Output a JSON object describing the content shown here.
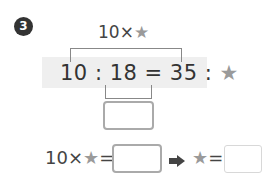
{
  "problem": {
    "number": "3",
    "top_label": {
      "prefix": "10×",
      "star": "★"
    },
    "equation": {
      "left": "10 : 18",
      "equals": " = ",
      "right_prefix": "35 : ",
      "star": "★"
    },
    "answer_box_1": {
      "value": ""
    },
    "second_line": {
      "prefix": "10×",
      "star": "★",
      "equals": "=",
      "answer_box_2": {
        "value": ""
      },
      "arrow": "arrow-right-icon",
      "result_star": "★",
      "result_equals": "=",
      "answer_box_3": {
        "value": ""
      }
    }
  },
  "colors": {
    "text": "#333333",
    "star": "#9a9a9a",
    "band": "#efefef",
    "bracket": "#888888",
    "box_border": "#aaaaaa",
    "box_border_light": "#d8d8d8"
  }
}
